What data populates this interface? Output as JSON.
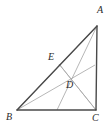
{
  "figure": {
    "kind": "geometry-diagram",
    "shape": "triangle-with-cevians",
    "background_color": "#ffffff",
    "side_color": "#4a4a4a",
    "cevian_color": "#9a9a9a",
    "label_color": "#2b2b2b"
  },
  "labels": {
    "A": "A",
    "B": "B",
    "C": "C",
    "D": "D",
    "E": "E"
  },
  "label_positions": {
    "A": {
      "x": 97,
      "y": 5
    },
    "B": {
      "x": 6,
      "y": 112
    },
    "C": {
      "x": 92,
      "y": 113
    },
    "D": {
      "x": 66,
      "y": 80
    },
    "E": {
      "x": 48,
      "y": 52
    }
  },
  "points": {
    "A": {
      "x": 97,
      "y": 26
    },
    "B": {
      "x": 17,
      "y": 110
    },
    "C": {
      "x": 96,
      "y": 110
    },
    "E": {
      "x": 59,
      "y": 64
    },
    "D": {
      "x": 63,
      "y": 75
    },
    "F_on_BC": {
      "x": 57,
      "y": 110
    },
    "G_on_AC": {
      "x": 95,
      "y": 65
    }
  },
  "segments": [
    {
      "name": "side-AB",
      "from": "A",
      "to": "B",
      "style": "side"
    },
    {
      "name": "side-BC",
      "from": "B",
      "to": "C",
      "style": "side"
    },
    {
      "name": "side-CA",
      "from": "C",
      "to": "A",
      "style": "side"
    },
    {
      "name": "cevian-A-to-BC",
      "from": "A",
      "to": "F_on_BC",
      "style": "cevian"
    },
    {
      "name": "cevian-B-to-AC",
      "from": "B",
      "to": "G_on_AC",
      "style": "cevian"
    },
    {
      "name": "cevian-C-to-E",
      "from": "C",
      "to": "E",
      "style": "cevian"
    },
    {
      "name": "segment-B-to-A-interior",
      "from": "B",
      "to": "A",
      "style": "cevian"
    },
    {
      "name": "segment-E-to-C",
      "from": "E",
      "to": "C",
      "style": "cevian"
    }
  ]
}
